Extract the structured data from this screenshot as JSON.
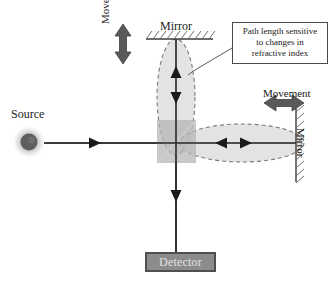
{
  "figure": {
    "type": "michelson-interferometer-diagram",
    "background_color": "#ffffff"
  },
  "labels": {
    "source": "Source",
    "mirror_top": "Mirror",
    "mirror_right": "Mirror",
    "movement_left": "Movement",
    "movement_right": "Movement",
    "detector": "Detector"
  },
  "callout": {
    "line1": "Path length sensitive",
    "line2": "to changes in",
    "line3": "refractive index",
    "text": "Path length sensitive to changes in refractive index"
  },
  "colors": {
    "beam_line": "#2b2b2b",
    "arrowhead": "#1a1a1a",
    "source_dot": "#5e5e5e",
    "source_glow": "#9a9a9a",
    "beam_splitter_fill": "#b4b4b4",
    "ellipse_fill": "#d9d9d9",
    "ellipse_dash": "#7a7a7a",
    "mirror_line": "#3b3b3b",
    "hatch": "#6e6e6e",
    "detector_fill": "#8c8c8c",
    "detector_border": "#4f4f4f",
    "detector_text": "#e2e2e2",
    "callout_border": "#4a4a4a",
    "callout_fill": "#ffffff",
    "movement_arrow": "#595959",
    "text": "#1a1a1a"
  },
  "geometry": {
    "beam_splitter_center": [
      176,
      143
    ],
    "source_center": [
      29,
      142
    ],
    "top_mirror_y": 39,
    "right_mirror_x": 296,
    "detector_y": 252
  }
}
